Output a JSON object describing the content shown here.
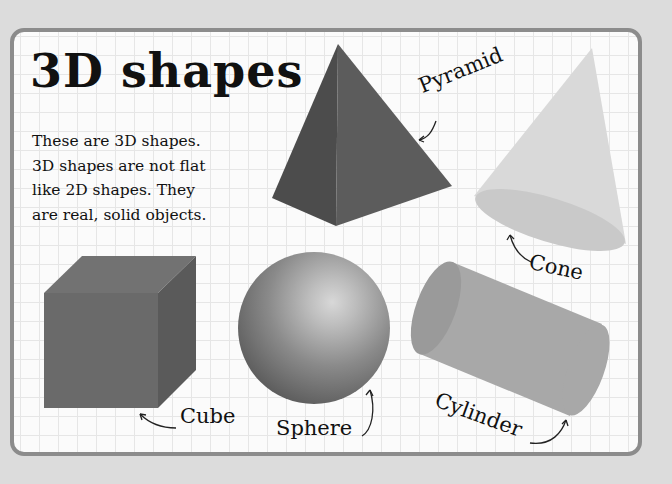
{
  "page": {
    "title": "3D shapes",
    "intro_lines": [
      "These are 3D shapes.",
      "3D shapes are not flat",
      "like 2D shapes. They",
      "are real, solid objects."
    ]
  },
  "shapes": [
    {
      "name": "Pyramid",
      "color": "#555555"
    },
    {
      "name": "Cone",
      "color": "#d6d6d6"
    },
    {
      "name": "Cube",
      "color": "#6a6a6a"
    },
    {
      "name": "Sphere",
      "color": "#7a7a7a"
    },
    {
      "name": "Cylinder",
      "color": "#a8a8a8"
    }
  ],
  "colors": {
    "background": "#dcdcdc",
    "panel": "#fbfbfb",
    "panel_border": "#8c8c8c",
    "grid": "#e6e6e6",
    "text": "#111111"
  }
}
